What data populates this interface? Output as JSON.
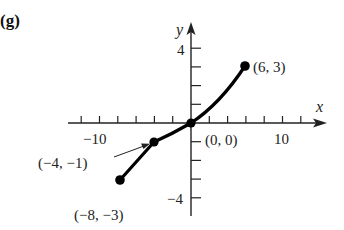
{
  "panel_label": "(g)",
  "chart_data": {
    "type": "line",
    "title": "",
    "xlabel": "x",
    "ylabel": "y",
    "xlim": [
      -14,
      14
    ],
    "ylim": [
      -5,
      5
    ],
    "x_tick_step": 2,
    "y_tick_step": 1,
    "x_tick_labels": [
      {
        "value": -10,
        "label": "−10"
      },
      {
        "value": 10,
        "label": "10"
      }
    ],
    "y_tick_labels": [
      {
        "value": 4,
        "label": "4"
      },
      {
        "value": -4,
        "label": "−4"
      }
    ],
    "grid": false,
    "legend": null,
    "series": [
      {
        "name": "piecewise curve",
        "segments": [
          {
            "kind": "linear",
            "from": [
              -8,
              -3
            ],
            "to": [
              -4,
              -1
            ]
          },
          {
            "kind": "curve",
            "from": [
              -4,
              -1
            ],
            "to": [
              6,
              3
            ],
            "through": [
              0,
              0
            ]
          }
        ],
        "x": [
          -8,
          -4,
          0,
          6
        ],
        "y": [
          -3,
          -1,
          0,
          3
        ]
      }
    ],
    "points": [
      {
        "x": -8,
        "y": -3,
        "label": "(−8, −3)"
      },
      {
        "x": -4,
        "y": -1,
        "label": "(−4, −1)",
        "annotation": "arrow"
      },
      {
        "x": 0,
        "y": 0,
        "label": "(0, 0)"
      },
      {
        "x": 6,
        "y": 3,
        "label": "(6, 3)"
      }
    ]
  },
  "labels": {
    "x_axis": "x",
    "y_axis": "y",
    "x_neg": "−10",
    "x_pos": "10",
    "y_pos": "4",
    "y_neg": "−4",
    "p1": "(−8, −3)",
    "p2": "(−4, −1)",
    "p3": "(0, 0)",
    "p4": "(6, 3)"
  }
}
